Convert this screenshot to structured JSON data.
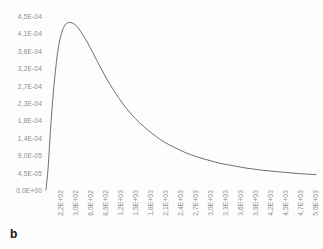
{
  "figure": {
    "panel_label": "b",
    "background_color": "#fdfdfd",
    "line_color": "#6e6e6e"
  },
  "chart_data": {
    "type": "line",
    "title": "",
    "subtitle": "",
    "xlabel": "",
    "ylabel": "",
    "grid": false,
    "legend": null,
    "legend_position": "none",
    "line_color": "#6e6e6e",
    "line_width": 1,
    "marker": "none",
    "x_tick_labels": [
      "2,2E+02",
      "3,0E+02",
      "6,0E+02",
      "8,9E+02",
      "1,2E+03",
      "1,5E+03",
      "1,8E+03",
      "2,1E+03",
      "2,4E+03",
      "2,7E+03",
      "3,0E+03",
      "3,3E+03",
      "3,6E+03",
      "3,9E+03",
      "4,2E+03",
      "4,5E+03",
      "4,7E+03",
      "5,0E+03"
    ],
    "y_tick_labels": [
      "4,5E-04",
      "4,1E-04",
      "3,6E-04",
      "3,2E-04",
      "2,7E-04",
      "2,3E-04",
      "1,8E-04",
      "1,4E-04",
      "9,0E-05",
      "4,5E-05",
      "0,0E+00"
    ],
    "y_tick_values": [
      0.00045,
      0.00041,
      0.00036,
      0.00032,
      0.00027,
      0.00023,
      0.00018,
      0.00014,
      9e-05,
      4.5e-05,
      0.0
    ],
    "ylim": [
      0.0,
      0.00045
    ],
    "xlim": [
      220,
      5000
    ],
    "x": [
      220,
      260,
      300,
      360,
      430,
      500,
      560,
      600,
      660,
      720,
      780,
      830,
      890,
      960,
      1040,
      1120,
      1200,
      1300,
      1400,
      1500,
      1650,
      1800,
      1950,
      2100,
      2250,
      2400,
      2550,
      2700,
      2850,
      3000,
      3150,
      3300,
      3450,
      3600,
      3750,
      3900,
      4050,
      4200,
      4350,
      4500,
      4650,
      4800,
      5000
    ],
    "values": [
      0.0,
      6.2e-05,
      0.000157,
      0.000268,
      0.00036,
      0.000408,
      0.000427,
      0.000432,
      0.000433,
      0.000429,
      0.000421,
      0.000411,
      0.000397,
      0.00038,
      0.000358,
      0.000335,
      0.000313,
      0.000286,
      0.000262,
      0.00024,
      0.00021,
      0.000185,
      0.000164,
      0.000146,
      0.00013,
      0.000117,
      0.000106,
      9.6e-05,
      8.8e-05,
      8.1e-05,
      7.5e-05,
      6.9e-05,
      6.5e-05,
      6.1e-05,
      5.7e-05,
      5.4e-05,
      5.1e-05,
      4.9e-05,
      4.7e-05,
      4.5e-05,
      4.3e-05,
      4.15e-05,
      4e-05
    ]
  }
}
